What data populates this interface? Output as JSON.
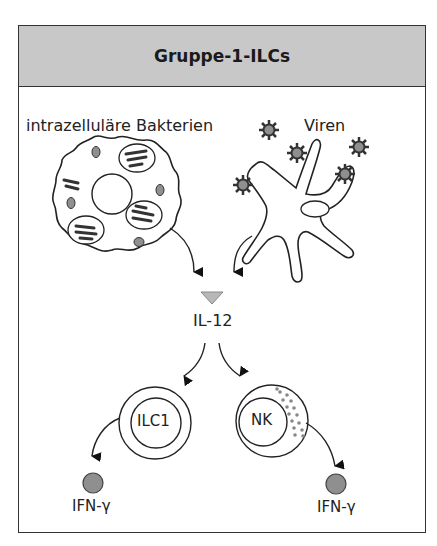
{
  "title": "Gruppe-1-ILCs",
  "sources": {
    "bacteria_label": "intrazelluläre Bakterien",
    "virus_label": "Viren"
  },
  "cytokine": {
    "label": "IL-12"
  },
  "cells": {
    "ilc1": {
      "label": "ILC1"
    },
    "nk": {
      "label": "NK"
    }
  },
  "outputs": {
    "left": {
      "label": "IFN-γ"
    },
    "right": {
      "label": "IFN-γ"
    }
  },
  "colors": {
    "header_fill": "#c8c8c8",
    "outline": "#333333",
    "il12_triangle": "#b8b8b8",
    "ifn_circle": "#8f8f8f",
    "granule": "#888888",
    "virus": "#444444"
  }
}
